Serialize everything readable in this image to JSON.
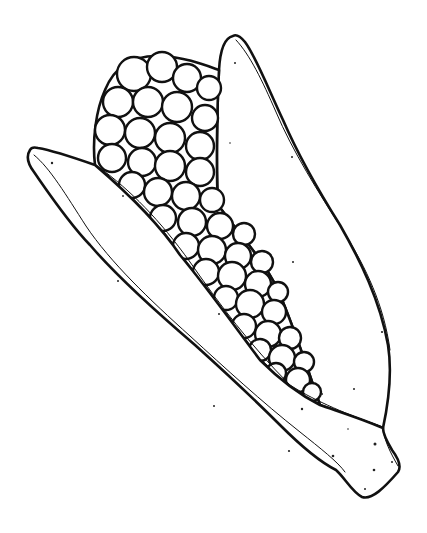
{
  "image": {
    "subject": "Corn cob coloring-page line drawing",
    "background": "#ffffff",
    "ink_color": "#111111",
    "style": "black outline, no fill"
  },
  "parts": {
    "left_husk": {
      "label": "left-husk-leaf"
    },
    "right_husk": {
      "label": "right-husk-leaf"
    },
    "cob": {
      "label": "kernel-cob",
      "kernel_count_visible": 56
    },
    "stem": {
      "label": "stem-end"
    }
  }
}
